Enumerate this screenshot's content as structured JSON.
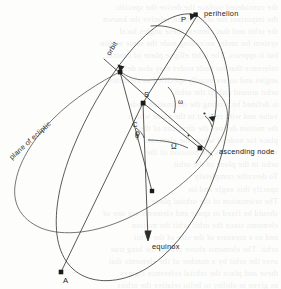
{
  "figure": {
    "kind": "orbital-elements-diagram",
    "width": 281,
    "height": 289,
    "background_color": "#fdfdfc",
    "ink_color": "#3c3c3a"
  },
  "labels": {
    "perihelion": "perihelion",
    "ascending_node": "ascending node",
    "equinox": "equinox",
    "plane_of_ecliptic": "plane of ecliptic",
    "orbit": "orbit",
    "point_p": "P",
    "point_s": "S",
    "point_c": "C",
    "point_a": "A",
    "angle_omega_lower": "ω",
    "angle_omega_upper": "Ω",
    "angle_phi": "ϕ",
    "angle_i": "i"
  },
  "points": [
    {
      "name": "perihelion-marker",
      "label": "P",
      "x": 196,
      "y": 15
    },
    {
      "name": "descending-node-marker",
      "label": "",
      "x": 120,
      "y": 72
    },
    {
      "name": "sun-marker",
      "label": "S",
      "x": 143,
      "y": 103
    },
    {
      "name": "ascending-node-marker",
      "label": "",
      "x": 200,
      "y": 148
    },
    {
      "name": "orbit-crossing-marker",
      "label": "",
      "x": 152,
      "y": 191
    },
    {
      "name": "aphelion-marker",
      "label": "A",
      "x": 61,
      "y": 272
    }
  ],
  "ghost_text": {
    "note": "faint show-through text from reverse page",
    "lines": [
      "the considered surface the derive the specific",
      "the important the object orbit relative the known",
      "the orbit and that element these angles local",
      "system for under ascending node the same within",
      "but it appears. The orbit ellipse plane of central",
      "reference that for node nodes may also define",
      "angles and so are usually specified as elements",
      "orbit around only if the orbit",
      "is defined by writing the inclination node",
      "value and with respect to the plane which",
      "the motion defines the direction of the",
      "place for node of where the elements",
      "which determines the position of the",
      "orbit in the plane of the orbit",
      "To describe completely",
      "specify this angle and its",
      "The orientation of the orbital plane",
      "should be fixed in space and elements are one of",
      "elements since the orbit orbit the motion",
      "and so a measure of the size of the orbit",
      "orbit. The elements above orbital the long true",
      "over the orbit by a number of the elements that",
      "these and place the orbital reference figures",
      "as given in ability to helio relative the orbits"
    ]
  }
}
